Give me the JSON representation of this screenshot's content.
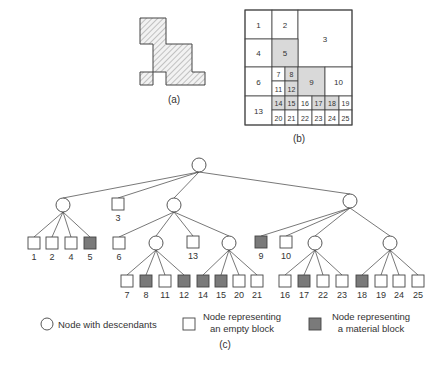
{
  "colors": {
    "stroke": "#444444",
    "edge": "#555555",
    "material": "#7a7a7a",
    "cell_shade": "#d9d9d9",
    "hatch": "#9a9a9a",
    "text": "#333333"
  },
  "captions": {
    "a": "(a)",
    "b": "(b)",
    "c": "(c)"
  },
  "grid_cells": [
    {
      "id": "1",
      "x": 245,
      "y": 10,
      "w": 27,
      "h": 29,
      "shaded": false
    },
    {
      "id": "2",
      "x": 272,
      "y": 10,
      "w": 26,
      "h": 29,
      "shaded": false
    },
    {
      "id": "3",
      "x": 298,
      "y": 10,
      "w": 54,
      "h": 57,
      "shaded": false
    },
    {
      "id": "4",
      "x": 245,
      "y": 39,
      "w": 27,
      "h": 28,
      "shaded": false
    },
    {
      "id": "5",
      "x": 272,
      "y": 39,
      "w": 26,
      "h": 28,
      "shaded": true
    },
    {
      "id": "6",
      "x": 245,
      "y": 67,
      "w": 27,
      "h": 29,
      "shaded": false
    },
    {
      "id": "7",
      "x": 272,
      "y": 67,
      "w": 13,
      "h": 14,
      "shaded": false
    },
    {
      "id": "8",
      "x": 285,
      "y": 67,
      "w": 13,
      "h": 14,
      "shaded": true
    },
    {
      "id": "11",
      "x": 272,
      "y": 81,
      "w": 13,
      "h": 15,
      "shaded": false
    },
    {
      "id": "12",
      "x": 285,
      "y": 81,
      "w": 13,
      "h": 15,
      "shaded": true
    },
    {
      "id": "9",
      "x": 298,
      "y": 67,
      "w": 27,
      "h": 29,
      "shaded": true
    },
    {
      "id": "10",
      "x": 325,
      "y": 67,
      "w": 27,
      "h": 29,
      "shaded": false
    },
    {
      "id": "13",
      "x": 245,
      "y": 96,
      "w": 27,
      "h": 29,
      "shaded": false
    },
    {
      "id": "14",
      "x": 272,
      "y": 96,
      "w": 13,
      "h": 14,
      "shaded": true
    },
    {
      "id": "15",
      "x": 285,
      "y": 96,
      "w": 13,
      "h": 14,
      "shaded": true
    },
    {
      "id": "16",
      "x": 298,
      "y": 96,
      "w": 14,
      "h": 14,
      "shaded": false
    },
    {
      "id": "17",
      "x": 312,
      "y": 96,
      "w": 13,
      "h": 14,
      "shaded": true
    },
    {
      "id": "18",
      "x": 325,
      "y": 96,
      "w": 14,
      "h": 14,
      "shaded": true
    },
    {
      "id": "19",
      "x": 339,
      "y": 96,
      "w": 13,
      "h": 14,
      "shaded": false
    },
    {
      "id": "20",
      "x": 272,
      "y": 110,
      "w": 13,
      "h": 15,
      "shaded": false
    },
    {
      "id": "21",
      "x": 285,
      "y": 110,
      "w": 13,
      "h": 15,
      "shaded": false
    },
    {
      "id": "22",
      "x": 298,
      "y": 110,
      "w": 14,
      "h": 15,
      "shaded": false
    },
    {
      "id": "23",
      "x": 312,
      "y": 110,
      "w": 13,
      "h": 15,
      "shaded": false
    },
    {
      "id": "24",
      "x": 325,
      "y": 110,
      "w": 14,
      "h": 15,
      "shaded": false
    },
    {
      "id": "25",
      "x": 339,
      "y": 110,
      "w": 13,
      "h": 15,
      "shaded": false
    }
  ],
  "tree": {
    "root": {
      "x": 199,
      "y": 165
    },
    "level1": [
      {
        "type": "circle",
        "x": 63,
        "y": 205,
        "label": ""
      },
      {
        "type": "empty",
        "x": 118,
        "y": 204,
        "label": "3"
      },
      {
        "type": "circle",
        "x": 174,
        "y": 205,
        "label": ""
      },
      {
        "type": "circle",
        "x": 350,
        "y": 201,
        "label": ""
      }
    ],
    "level2": [
      {
        "type": "empty",
        "x": 34,
        "y": 243,
        "label": "1",
        "parent": 0
      },
      {
        "type": "empty",
        "x": 52,
        "y": 243,
        "label": "2",
        "parent": 0
      },
      {
        "type": "empty",
        "x": 71,
        "y": 243,
        "label": "4",
        "parent": 0
      },
      {
        "type": "material",
        "x": 90,
        "y": 243,
        "label": "5",
        "parent": 0
      },
      {
        "type": "empty",
        "x": 119,
        "y": 243,
        "label": "6",
        "parent": 2
      },
      {
        "type": "circle",
        "x": 156,
        "y": 243,
        "label": "",
        "parent": 2
      },
      {
        "type": "empty",
        "x": 193,
        "y": 242,
        "label": "13",
        "parent": 2
      },
      {
        "type": "circle",
        "x": 229,
        "y": 243,
        "label": "",
        "parent": 2
      },
      {
        "type": "material",
        "x": 261,
        "y": 242,
        "label": "9",
        "parent": 3
      },
      {
        "type": "empty",
        "x": 286,
        "y": 242,
        "label": "10",
        "parent": 3
      },
      {
        "type": "circle",
        "x": 315,
        "y": 243,
        "label": "",
        "parent": 3
      },
      {
        "type": "circle",
        "x": 390,
        "y": 243,
        "label": "",
        "parent": 3
      }
    ],
    "level3": [
      {
        "type": "empty",
        "x": 127,
        "y": 281,
        "label": "7",
        "parent": 5
      },
      {
        "type": "material",
        "x": 146,
        "y": 281,
        "label": "8",
        "parent": 5
      },
      {
        "type": "empty",
        "x": 165,
        "y": 281,
        "label": "11",
        "parent": 5
      },
      {
        "type": "material",
        "x": 184,
        "y": 281,
        "label": "12",
        "parent": 5
      },
      {
        "type": "material",
        "x": 203,
        "y": 281,
        "label": "14",
        "parent": 7
      },
      {
        "type": "material",
        "x": 221,
        "y": 281,
        "label": "15",
        "parent": 7
      },
      {
        "type": "empty",
        "x": 239,
        "y": 281,
        "label": "20",
        "parent": 7
      },
      {
        "type": "empty",
        "x": 257,
        "y": 281,
        "label": "21",
        "parent": 7
      },
      {
        "type": "empty",
        "x": 285,
        "y": 281,
        "label": "16",
        "parent": 10
      },
      {
        "type": "material",
        "x": 304,
        "y": 281,
        "label": "17",
        "parent": 10
      },
      {
        "type": "empty",
        "x": 323,
        "y": 281,
        "label": "22",
        "parent": 10
      },
      {
        "type": "empty",
        "x": 342,
        "y": 281,
        "label": "23",
        "parent": 10
      },
      {
        "type": "material",
        "x": 362,
        "y": 281,
        "label": "18",
        "parent": 11
      },
      {
        "type": "empty",
        "x": 381,
        "y": 281,
        "label": "19",
        "parent": 11
      },
      {
        "type": "empty",
        "x": 399,
        "y": 281,
        "label": "24",
        "parent": 11
      },
      {
        "type": "empty",
        "x": 418,
        "y": 281,
        "label": "25",
        "parent": 11
      }
    ]
  },
  "legend": {
    "circle_label": "Node with descendants",
    "empty_label_line1": "Node representing",
    "empty_label_line2": "an empty block",
    "material_label_line1": "Node representing",
    "material_label_line2": "a material block"
  }
}
